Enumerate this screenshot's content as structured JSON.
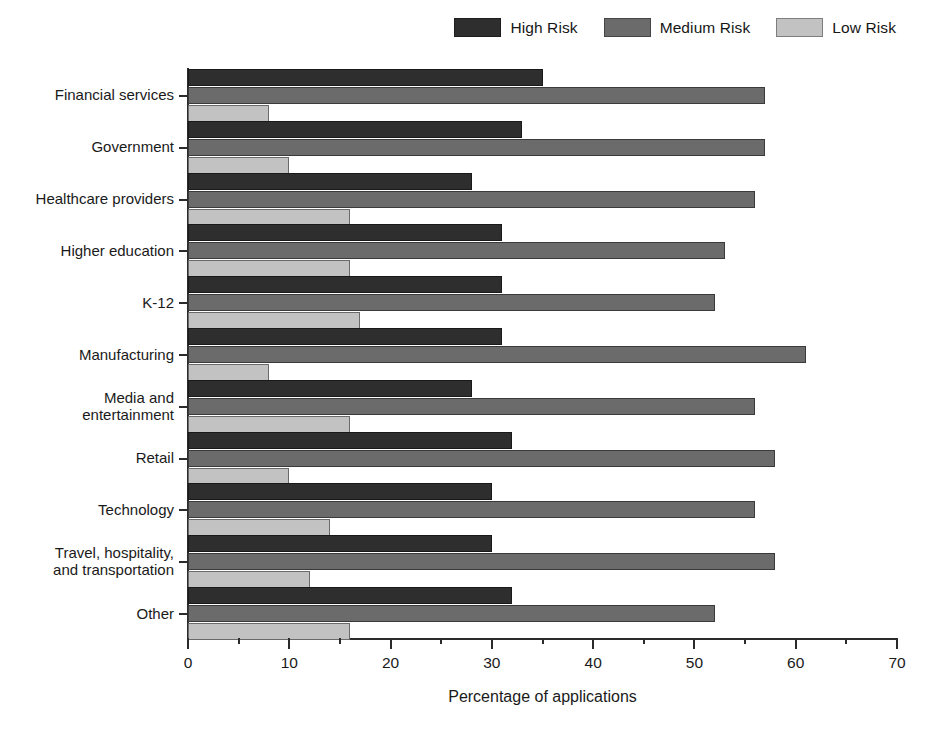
{
  "chart_data": {
    "type": "bar",
    "orientation": "horizontal",
    "title": "",
    "xlabel": "Percentage of applications",
    "ylabel": "",
    "xlim": [
      0,
      70
    ],
    "xticks": [
      0,
      10,
      20,
      30,
      40,
      50,
      60,
      70
    ],
    "xtick_labels": [
      "0",
      "10",
      "20",
      "30",
      "40",
      "50",
      "60",
      "70"
    ],
    "minor_xticks": [
      5,
      15,
      25,
      35,
      45,
      55,
      65
    ],
    "grid": false,
    "legend_position": "top-right",
    "categories": [
      "Financial services",
      "Government",
      "Healthcare providers",
      "Higher education",
      "K-12",
      "Manufacturing",
      "Media and\nentertainment",
      "Retail",
      "Technology",
      "Travel, hospitality,\nand transportation",
      "Other"
    ],
    "series": [
      {
        "name": "High Risk",
        "color": "#2e2e2e",
        "values": [
          35,
          33,
          28,
          31,
          31,
          31,
          28,
          32,
          30,
          30,
          32
        ]
      },
      {
        "name": "Medium Risk",
        "color": "#6b6b6b",
        "values": [
          57,
          57,
          56,
          53,
          52,
          61,
          56,
          58,
          56,
          58,
          52
        ]
      },
      {
        "name": "Low Risk",
        "color": "#c2c2c2",
        "values": [
          8,
          10,
          16,
          16,
          17,
          8,
          16,
          10,
          14,
          12,
          16
        ]
      }
    ]
  }
}
